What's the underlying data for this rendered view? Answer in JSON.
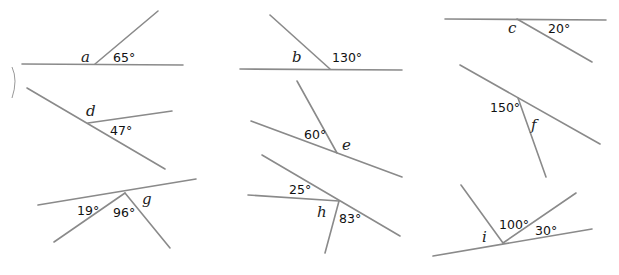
{
  "line_color": "#8a8a8a",
  "diagrams": [
    {
      "id": "a",
      "variable": "a",
      "known": [
        {
          "label": "65°",
          "x": 113,
          "y": 62
        }
      ],
      "var_pos": {
        "x": 81,
        "y": 62
      },
      "lines": [
        [
          22,
          64,
          183,
          65
        ],
        [
          95,
          64,
          158,
          11
        ]
      ]
    },
    {
      "id": "b",
      "variable": "b",
      "known": [
        {
          "label": "130°",
          "x": 332,
          "y": 62
        }
      ],
      "var_pos": {
        "x": 292,
        "y": 62
      },
      "lines": [
        [
          240,
          69,
          402,
          70
        ],
        [
          330,
          69,
          270,
          15
        ]
      ]
    },
    {
      "id": "c",
      "variable": "c",
      "known": [
        {
          "label": "20°",
          "x": 548,
          "y": 33
        }
      ],
      "var_pos": {
        "x": 508,
        "y": 33
      },
      "lines": [
        [
          445,
          19,
          606,
          20
        ],
        [
          517,
          19,
          592,
          62
        ]
      ]
    },
    {
      "id": "d",
      "variable": "d",
      "known": [
        {
          "label": "47°",
          "x": 110,
          "y": 135
        }
      ],
      "var_pos": {
        "x": 86,
        "y": 116
      },
      "lines": [
        [
          27,
          88,
          165,
          169
        ],
        [
          88,
          123,
          172,
          111
        ]
      ]
    },
    {
      "id": "e",
      "variable": "e",
      "known": [
        {
          "label": "60°",
          "x": 304,
          "y": 139
        }
      ],
      "var_pos": {
        "x": 342,
        "y": 150
      },
      "lines": [
        [
          251,
          121,
          402,
          177
        ],
        [
          337,
          153,
          297,
          81
        ]
      ]
    },
    {
      "id": "f",
      "variable": "f",
      "known": [
        {
          "label": "150°",
          "x": 490,
          "y": 112
        }
      ],
      "var_pos": {
        "x": 531,
        "y": 130
      },
      "lines": [
        [
          460,
          65,
          600,
          144
        ],
        [
          518,
          98,
          546,
          177
        ]
      ]
    },
    {
      "id": "g",
      "variable": "g",
      "known": [
        {
          "label": "19°",
          "x": 77,
          "y": 215
        },
        {
          "label": "96°",
          "x": 113,
          "y": 217
        }
      ],
      "var_pos": {
        "x": 142,
        "y": 204
      },
      "lines": [
        [
          38,
          205,
          196,
          179
        ],
        [
          125,
          193,
          54,
          242
        ],
        [
          125,
          193,
          170,
          248
        ]
      ]
    },
    {
      "id": "h",
      "variable": "h",
      "known": [
        {
          "label": "25°",
          "x": 289,
          "y": 194
        },
        {
          "label": "83°",
          "x": 339,
          "y": 223
        }
      ],
      "var_pos": {
        "x": 317,
        "y": 217
      },
      "lines": [
        [
          262,
          155,
          400,
          236
        ],
        [
          248,
          195,
          339,
          201
        ],
        [
          339,
          201,
          325,
          253
        ]
      ]
    },
    {
      "id": "i",
      "variable": "i",
      "known": [
        {
          "label": "100°",
          "x": 499,
          "y": 229
        },
        {
          "label": "30°",
          "x": 535,
          "y": 235
        }
      ],
      "var_pos": {
        "x": 482,
        "y": 242
      },
      "lines": [
        [
          433,
          256,
          592,
          229
        ],
        [
          503,
          243,
          461,
          185
        ],
        [
          503,
          243,
          576,
          193
        ]
      ]
    }
  ]
}
